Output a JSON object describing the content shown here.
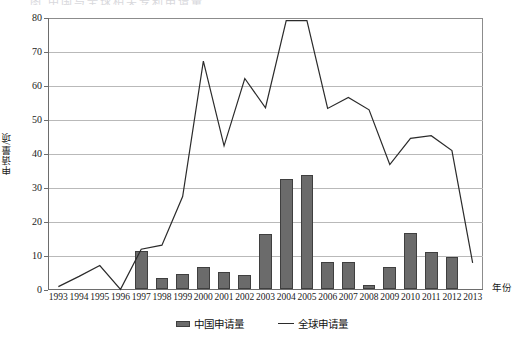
{
  "chart_data": {
    "type": "bar",
    "title": "",
    "title_remnant": "图  中国与全球相关专利申请量",
    "xlabel": "年份",
    "ylabel": "申请量/项",
    "ylim": [
      0,
      80
    ],
    "ytick_step": 10,
    "grid": true,
    "legend_position": "bottom-center",
    "categories": [
      "1993",
      "1994",
      "1995",
      "1996",
      "1997",
      "1998",
      "1999",
      "2000",
      "2001",
      "2002",
      "2003",
      "2004",
      "2005",
      "2006",
      "2007",
      "2008",
      "2009",
      "2010",
      "2011",
      "2012",
      "2013"
    ],
    "yticks": [
      "0",
      "10",
      "20",
      "30",
      "40",
      "50",
      "60",
      "70",
      "80"
    ],
    "series": [
      {
        "name": "中国申请量",
        "type": "bar",
        "color": "#6b6b6b",
        "values": [
          0,
          0,
          0,
          0,
          11.3,
          3.2,
          4.4,
          6.4,
          5.1,
          4.2,
          16.3,
          32.4,
          33.5,
          7.8,
          8.0,
          1.2,
          6.6,
          16.5,
          10.8,
          9.4,
          0
        ]
      },
      {
        "name": "全球申请量",
        "type": "line",
        "color": "#2b2b2b",
        "values": [
          1.0,
          4.0,
          7.2,
          0.2,
          12.0,
          13.2,
          27.5,
          67.3,
          42.4,
          62.2,
          53.6,
          79.2,
          79.2,
          53.4,
          56.6,
          53.0,
          36.9,
          44.6,
          45.4,
          41.0,
          8.0
        ]
      }
    ]
  },
  "legend": {
    "items": [
      {
        "label": "中国申请量",
        "marker": "bar-swatch"
      },
      {
        "label": "全球申请量",
        "marker": "line-swatch"
      }
    ]
  }
}
